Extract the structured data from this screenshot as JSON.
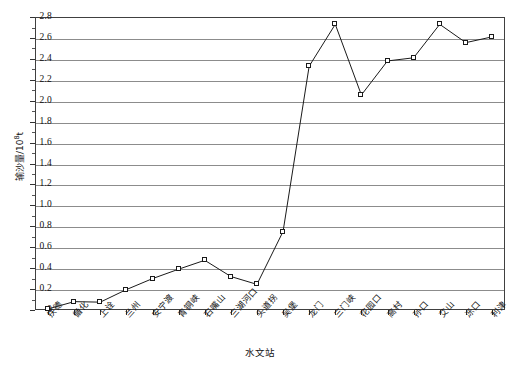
{
  "chart_data": {
    "type": "line",
    "title": "",
    "xlabel": "水文站",
    "ylabel": "输沙量/10⁸t",
    "ylabel_main": "输沙量/10",
    "ylabel_exp": "8",
    "ylabel_unit": "t",
    "ylim": [
      0,
      2.8
    ],
    "ytick_step": 0.2,
    "grid": true,
    "legend": "none",
    "marker": "open-square",
    "line_color": "#1a1a1a",
    "grid_color": "#8c8c8c",
    "categories": [
      "扶德",
      "循化",
      "上诠",
      "兰州",
      "安宁渡",
      "青铜峡",
      "石嘴山",
      "三湖河口",
      "头道拐",
      "吴堡",
      "龙门",
      "三门峡",
      "花园口",
      "高村",
      "孙口",
      "艾山",
      "泺口",
      "利津"
    ],
    "values": [
      0.01,
      0.08,
      0.075,
      0.195,
      0.3,
      0.39,
      0.475,
      0.32,
      0.245,
      0.75,
      2.33,
      2.73,
      2.055,
      2.38,
      2.41,
      2.73,
      2.555,
      2.61
    ],
    "ytick_labels": [
      "0",
      "0.2",
      "0.4",
      "0.6",
      "0.8",
      "1.0",
      "1.2",
      "1.4",
      "1.6",
      "1.8",
      "2.0",
      "2.2",
      "2.4",
      "2.6",
      "2.8"
    ],
    "ytick_values": [
      0,
      0.2,
      0.4,
      0.6,
      0.8,
      1.0,
      1.2,
      1.4,
      1.6,
      1.8,
      2.0,
      2.2,
      2.4,
      2.6,
      2.8
    ]
  }
}
